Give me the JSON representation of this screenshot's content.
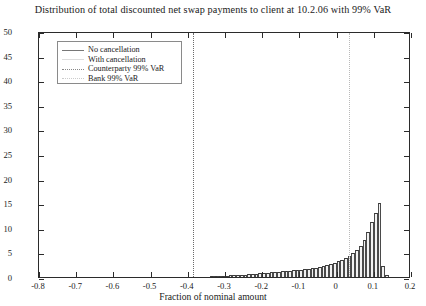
{
  "chart_data": {
    "type": "bar",
    "title": "Distribution of total discounted net swap payments to client at 10.2.06 with 99% VaR",
    "xlabel": "Fraction of nominal amount",
    "ylabel": "",
    "xlim": [
      -0.8,
      0.2
    ],
    "ylim": [
      0,
      50
    ],
    "xticks": [
      -0.8,
      -0.7,
      -0.6,
      -0.5,
      -0.4,
      -0.3,
      -0.2,
      -0.1,
      0,
      0.1,
      0.2
    ],
    "xticklabels": [
      "-0.8",
      "-0.7",
      "-0.6",
      "-0.5",
      "-0.4",
      "-0.3",
      "-0.2",
      "-0.1",
      "0",
      "0.1",
      "0.2"
    ],
    "yticks": [
      0,
      5,
      10,
      15,
      20,
      25,
      30,
      35,
      40,
      45,
      50
    ],
    "yticklabels": [
      "0",
      "5",
      "10",
      "15",
      "20",
      "25",
      "30",
      "35",
      "40",
      "45",
      "50"
    ],
    "grid": false,
    "legend_position": "upper-left",
    "legend": [
      {
        "label": "No cancellation",
        "style": "solid"
      },
      {
        "label": "With cancellation",
        "style": "solid-light"
      },
      {
        "label": "Counterparty 99% VaR",
        "style": "dotted"
      },
      {
        "label": "Bank 99% VaR",
        "style": "dotted-light"
      }
    ],
    "annotations": [
      {
        "name": "counterparty-var-line",
        "type": "vline",
        "x": -0.385,
        "label": "Counterparty 99% VaR"
      },
      {
        "name": "bank-var-line",
        "type": "vline",
        "x": 0.033,
        "label": "Bank 99% VaR"
      }
    ],
    "bin_width": 0.01,
    "bins": [
      {
        "x": -0.335,
        "value": 0.2
      },
      {
        "x": -0.325,
        "value": 0.2
      },
      {
        "x": -0.315,
        "value": 0.3
      },
      {
        "x": -0.305,
        "value": 0.3
      },
      {
        "x": -0.295,
        "value": 0.3
      },
      {
        "x": -0.285,
        "value": 0.4
      },
      {
        "x": -0.275,
        "value": 0.4
      },
      {
        "x": -0.265,
        "value": 0.4
      },
      {
        "x": -0.255,
        "value": 0.5
      },
      {
        "x": -0.245,
        "value": 0.5
      },
      {
        "x": -0.235,
        "value": 0.6
      },
      {
        "x": -0.225,
        "value": 0.6
      },
      {
        "x": -0.215,
        "value": 0.7
      },
      {
        "x": -0.205,
        "value": 0.8
      },
      {
        "x": -0.195,
        "value": 0.8
      },
      {
        "x": -0.185,
        "value": 0.9
      },
      {
        "x": -0.175,
        "value": 1.0
      },
      {
        "x": -0.165,
        "value": 1.0
      },
      {
        "x": -0.155,
        "value": 1.1
      },
      {
        "x": -0.145,
        "value": 1.2
      },
      {
        "x": -0.135,
        "value": 1.2
      },
      {
        "x": -0.125,
        "value": 1.3
      },
      {
        "x": -0.115,
        "value": 1.4
      },
      {
        "x": -0.105,
        "value": 1.4
      },
      {
        "x": -0.095,
        "value": 1.5
      },
      {
        "x": -0.085,
        "value": 1.6
      },
      {
        "x": -0.075,
        "value": 1.7
      },
      {
        "x": -0.065,
        "value": 1.8
      },
      {
        "x": -0.055,
        "value": 1.9
      },
      {
        "x": -0.045,
        "value": 2.1
      },
      {
        "x": -0.035,
        "value": 2.3
      },
      {
        "x": -0.025,
        "value": 2.5
      },
      {
        "x": -0.015,
        "value": 2.7
      },
      {
        "x": -0.005,
        "value": 2.9
      },
      {
        "x": 0.005,
        "value": 3.2
      },
      {
        "x": 0.015,
        "value": 3.5
      },
      {
        "x": 0.025,
        "value": 3.9
      },
      {
        "x": 0.035,
        "value": 4.3
      },
      {
        "x": 0.045,
        "value": 4.8
      },
      {
        "x": 0.055,
        "value": 5.5
      },
      {
        "x": 0.065,
        "value": 6.4
      },
      {
        "x": 0.075,
        "value": 7.6
      },
      {
        "x": 0.085,
        "value": 9.2
      },
      {
        "x": 0.095,
        "value": 11.2
      },
      {
        "x": 0.105,
        "value": 13.0
      },
      {
        "x": 0.115,
        "value": 15.0
      },
      {
        "x": 0.125,
        "value": 2.2
      },
      {
        "x": 0.135,
        "value": 0.4
      }
    ]
  }
}
